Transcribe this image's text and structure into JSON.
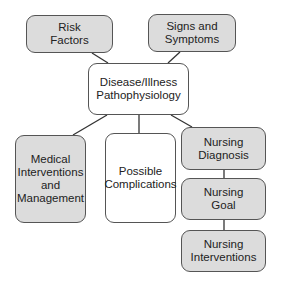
{
  "diagram": {
    "nodes": {
      "risk_factors": {
        "label": "Risk\nFactors",
        "fill": "#dcdcdc"
      },
      "signs_symptoms": {
        "label": "Signs and\nSymptoms",
        "fill": "#dcdcdc"
      },
      "disease": {
        "label": "Disease/Illness\nPathophysiology",
        "fill": "#ffffff"
      },
      "medical": {
        "label": "Medical\nInterventions\nand\nManagement",
        "fill": "#dcdcdc"
      },
      "complications": {
        "label": "Possible\nComplications",
        "fill": "#ffffff"
      },
      "nursing_diagnosis": {
        "label": "Nursing\nDiagnosis",
        "fill": "#dcdcdc"
      },
      "nursing_goal": {
        "label": "Nursing\nGoal",
        "fill": "#dcdcdc"
      },
      "nursing_interventions": {
        "label": "Nursing\nInterventions",
        "fill": "#dcdcdc"
      }
    },
    "edges": [
      [
        "risk_factors",
        "disease"
      ],
      [
        "signs_symptoms",
        "disease"
      ],
      [
        "disease",
        "medical"
      ],
      [
        "disease",
        "complications"
      ],
      [
        "disease",
        "nursing_diagnosis"
      ],
      [
        "nursing_diagnosis",
        "nursing_goal"
      ],
      [
        "nursing_goal",
        "nursing_interventions"
      ]
    ]
  }
}
